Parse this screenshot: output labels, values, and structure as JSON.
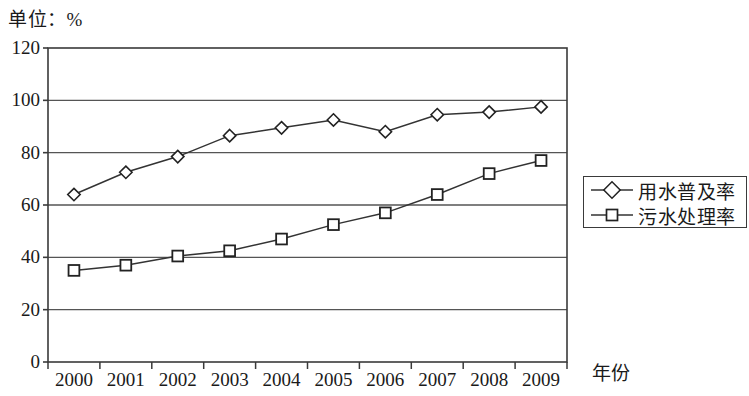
{
  "chart_data": {
    "type": "line",
    "title": "单位：%",
    "xlabel": "年份",
    "ylabel": "",
    "categories": [
      "2000",
      "2001",
      "2002",
      "2003",
      "2004",
      "2005",
      "2006",
      "2007",
      "2008",
      "2009"
    ],
    "series": [
      {
        "name": "用水普及率",
        "marker": "diamond",
        "values": [
          64,
          72.5,
          78.5,
          86.5,
          89.5,
          92.5,
          88,
          94.5,
          95.5,
          97.5
        ]
      },
      {
        "name": "污水处理率",
        "marker": "square",
        "values": [
          35,
          37,
          40.5,
          42.5,
          47,
          52.5,
          57,
          64,
          72,
          77
        ]
      }
    ],
    "ylim": [
      0,
      120
    ],
    "yticks": [
      0,
      20,
      40,
      60,
      80,
      100,
      120
    ],
    "ytick_labels": [
      "0",
      "20",
      "40",
      "60",
      "80",
      "100",
      "120"
    ],
    "grid": true,
    "grid_axis": "y",
    "legend_position": "right-middle",
    "colors": {
      "line": "#333333",
      "grid": "#555555",
      "frame": "#3a3a3a",
      "marker_fill": "#ffffff",
      "text": "#1a1a1a",
      "background": "#ffffff"
    }
  },
  "legend": {
    "items": [
      {
        "label": "用水普及率",
        "marker": "diamond"
      },
      {
        "label": "污水处理率",
        "marker": "square"
      }
    ]
  }
}
